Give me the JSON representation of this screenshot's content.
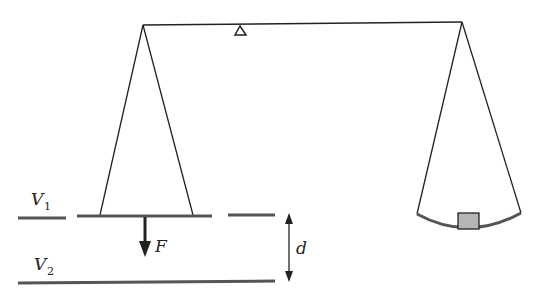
{
  "diagram": {
    "labels": {
      "v1": "V",
      "v1_sub": "1",
      "v2": "V",
      "v2_sub": "2",
      "force": "F",
      "distance": "d"
    },
    "colors": {
      "line": "#222222",
      "plate": "#555555",
      "mass_fill": "#b5b5b5"
    }
  }
}
